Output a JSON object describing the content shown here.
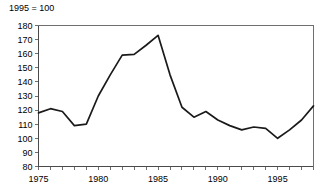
{
  "chart_data": {
    "type": "line",
    "title": "1995 = 100",
    "xlabel": "",
    "ylabel": "",
    "x": [
      1975,
      1976,
      1977,
      1978,
      1979,
      1980,
      1981,
      1982,
      1983,
      1984,
      1985,
      1986,
      1987,
      1988,
      1989,
      1990,
      1991,
      1992,
      1993,
      1994,
      1995,
      1996,
      1997,
      1998
    ],
    "values": [
      118,
      121,
      119,
      109,
      110,
      130,
      145,
      159,
      159.5,
      166,
      173,
      145,
      122,
      115,
      119,
      113,
      109,
      106,
      108,
      107,
      100,
      106,
      113,
      123
    ],
    "series": [
      {
        "name": "index",
        "values": [
          118,
          121,
          119,
          109,
          110,
          130,
          145,
          159,
          159.5,
          166,
          173,
          145,
          122,
          115,
          119,
          113,
          109,
          106,
          108,
          107,
          100,
          106,
          113,
          123
        ]
      }
    ],
    "xlim": [
      1975,
      1998
    ],
    "ylim": [
      80,
      180
    ],
    "y_ticks": [
      80,
      90,
      100,
      110,
      120,
      130,
      140,
      150,
      160,
      170,
      180
    ],
    "y_tick_labels": [
      "80",
      "90",
      "100",
      "110",
      "120",
      "130",
      "140",
      "150",
      "160",
      "170",
      "180"
    ],
    "x_ticks": [
      1975,
      1976,
      1977,
      1978,
      1979,
      1980,
      1981,
      1982,
      1983,
      1984,
      1985,
      1986,
      1987,
      1988,
      1989,
      1990,
      1991,
      1992,
      1993,
      1994,
      1995,
      1996,
      1997,
      1998
    ],
    "x_tick_labels_shown": [
      "1975",
      "1980",
      "1985",
      "1990",
      "1995"
    ],
    "x_tick_labels_shown_at": [
      1975,
      1980,
      1985,
      1990,
      1995
    ],
    "grid": false,
    "legend": false,
    "legend_position": "none",
    "line_color": "#1a1a1a",
    "axis_color": "#6f6f6f",
    "background_color": "#ffffff"
  }
}
